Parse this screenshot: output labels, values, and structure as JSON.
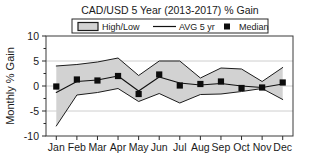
{
  "chart_data": {
    "type": "line",
    "title": "CAD/USD 5 Year (2013-2017) % Gain",
    "xlabel": "",
    "ylabel": "Monthly % Gain",
    "ylim": [
      -10,
      10
    ],
    "yticks": [
      10,
      5,
      0,
      -5,
      -10
    ],
    "ytick_labels": [
      "10",
      "5",
      "0",
      "-5",
      "-10"
    ],
    "grid": true,
    "grid_axis": "y",
    "legend_position": "top-center",
    "categories": [
      "Jan",
      "Feb",
      "Mar",
      "Apr",
      "May",
      "Jun",
      "Jul",
      "Aug",
      "Sep",
      "Oct",
      "Nov",
      "Dec"
    ],
    "series": [
      {
        "name": "High/Low",
        "type": "band",
        "high": [
          4.0,
          4.3,
          4.8,
          5.6,
          2.1,
          5.0,
          5.0,
          1.6,
          3.6,
          3.4,
          0.9,
          3.7
        ],
        "low": [
          -8.0,
          -1.8,
          -1.3,
          -0.5,
          -3.1,
          -1.5,
          -3.4,
          -1.7,
          -1.6,
          -1.1,
          -0.5,
          -2.7
        ]
      },
      {
        "name": "AVG 5 yr",
        "type": "line",
        "values": [
          -1.3,
          0.9,
          1.2,
          2.0,
          -1.0,
          1.8,
          0.6,
          0.2,
          0.5,
          0.0,
          -0.3,
          0.4
        ]
      },
      {
        "name": "Median",
        "type": "scatter",
        "values": [
          -0.1,
          1.3,
          1.1,
          2.0,
          -1.6,
          2.3,
          0.1,
          0.4,
          0.9,
          -0.4,
          -0.3,
          0.7
        ]
      }
    ]
  },
  "legend": {
    "items": [
      {
        "label": "High/Low",
        "marker": "filled-box",
        "color": "#d2d2d2"
      },
      {
        "label": "AVG 5 yr",
        "marker": "line",
        "color": "#111111"
      },
      {
        "label": "Median",
        "marker": "square",
        "color": "#0d0d0d"
      }
    ]
  },
  "colors": {
    "band_fill": "#d2d2d2",
    "band_edge": "#1c1c1c",
    "avg_line": "#111111",
    "median": "#0d0d0d",
    "gridline": "#c8c8c8",
    "frame": "#3a3a3a",
    "background": "#ffffff"
  }
}
